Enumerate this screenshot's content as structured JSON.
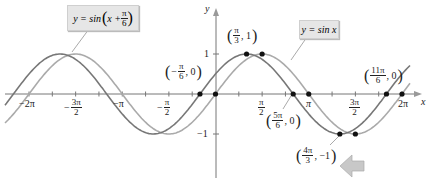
{
  "chart_data": {
    "type": "line",
    "title": "",
    "xlabel": "x",
    "ylabel": "y",
    "xlim": [
      -6.8,
      6.8
    ],
    "ylim": [
      -1.8,
      2.3
    ],
    "grid": false,
    "series": [
      {
        "name": "y = sin(x + π/6)",
        "color": "#777777",
        "function": "sin(x + pi/6)"
      },
      {
        "name": "y = sin x",
        "color": "#aaaaaa",
        "function": "sin(x)"
      }
    ],
    "x_ticks": [
      "-2π",
      "-3π/2",
      "-π",
      "-π/2",
      "π/2",
      "π",
      "3π/2",
      "2π"
    ],
    "y_ticks": [
      "1",
      "-1"
    ],
    "annotated_points": [
      {
        "label": "(-π/6, 0)",
        "x": -0.5236,
        "y": 0
      },
      {
        "label": "(π/3, 1)",
        "x": 1.0472,
        "y": 1
      },
      {
        "label": "(5π/6, 0)",
        "x": 2.618,
        "y": 0
      },
      {
        "label": "(4π/3, -1)",
        "x": 4.1888,
        "y": -1
      },
      {
        "label": "(11π/6, 0)",
        "x": 5.7596,
        "y": 0
      }
    ],
    "sin_points": [
      {
        "x": 0,
        "y": 0
      },
      {
        "x": 1.5708,
        "y": 1
      },
      {
        "x": 3.1416,
        "y": 0
      },
      {
        "x": 4.7124,
        "y": -1
      },
      {
        "x": 6.2832,
        "y": 0
      }
    ]
  },
  "labels": {
    "shifted_curve": {
      "lhs": "y = sin",
      "arg_x": "x +",
      "num": "π",
      "den": "6"
    },
    "base_curve": {
      "text_y": "y = sin ",
      "text_x": "x"
    },
    "axis_x": "x",
    "axis_y": "y",
    "y_tick_pos": "1",
    "y_tick_neg": "−1",
    "ticks": {
      "neg2pi": "−2π",
      "neg3pi2_num": "3π",
      "neg3pi2_den": "2",
      "neg_sign": "−",
      "negpi": "−π",
      "negpi2_num": "π",
      "negpi2_den": "2",
      "pi2_num": "π",
      "pi2_den": "2",
      "pi": "π",
      "threepi2_num": "3π",
      "threepi2_den": "2",
      "twopi": "2π"
    },
    "points": {
      "p1": {
        "sign": "−",
        "num": "π",
        "den": "6",
        "rest": ", 0"
      },
      "p2": {
        "num": "π",
        "den": "3",
        "rest": ", 1"
      },
      "p3": {
        "num": "5π",
        "den": "6",
        "rest": ", 0"
      },
      "p4": {
        "num": "4π",
        "den": "3",
        "rest": ", −1"
      },
      "p5": {
        "num": "11π",
        "den": "6",
        "rest": ", 0"
      }
    }
  }
}
